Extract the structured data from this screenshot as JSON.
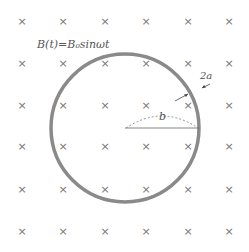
{
  "diagram": {
    "field_label": "B(t)=B₀sinωt",
    "radius_label": "b",
    "thickness_label": "2a",
    "field_symbol": "×",
    "grid": {
      "columns_x": [
        22,
        63,
        105,
        146,
        188,
        229
      ],
      "rows_y": [
        21,
        63,
        105,
        146,
        189,
        231
      ]
    },
    "ring": {
      "cx": 125,
      "cy": 128,
      "r": 74,
      "stroke": "#8a8a8a",
      "stroke_width": 3.5
    }
  }
}
